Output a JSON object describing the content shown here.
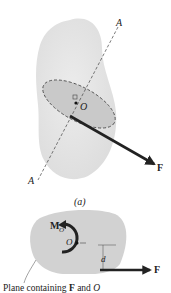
{
  "figure_a": {
    "axis_label_top": "A",
    "axis_label_bottom": "A",
    "point_label": "O",
    "force_label": "F",
    "caption": "(a)"
  },
  "figure_b": {
    "moment_label_main": "M",
    "moment_label_sub": "O",
    "point_label": "O",
    "distance_label": "d",
    "force_label": "F",
    "plane_caption_prefix": "Plane containing ",
    "plane_caption_F": "F",
    "plane_caption_and": " and ",
    "plane_caption_O": "O"
  },
  "colors": {
    "body_fill": "#e6e6e6",
    "plane_fill": "#c9c9c9",
    "plane_b_fill": "#d2d2d2",
    "ink": "#222222"
  }
}
